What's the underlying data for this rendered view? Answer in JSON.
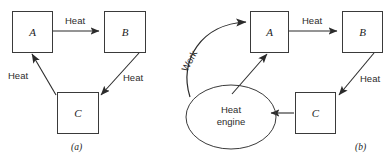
{
  "figure": {
    "type": "diagram",
    "title": "",
    "panels": [
      {
        "id": "a",
        "caption": "(a)",
        "nodes": [
          {
            "id": "A",
            "label": "A",
            "shape": "box"
          },
          {
            "id": "B",
            "label": "B",
            "shape": "box"
          },
          {
            "id": "C",
            "label": "C",
            "shape": "box"
          }
        ],
        "edges": [
          {
            "from": "A",
            "to": "B",
            "label": "Heat"
          },
          {
            "from": "B",
            "to": "C",
            "label": "Heat"
          },
          {
            "from": "C",
            "to": "A",
            "label": "Heat"
          }
        ]
      },
      {
        "id": "b",
        "caption": "(b)",
        "nodes": [
          {
            "id": "A",
            "label": "A",
            "shape": "box"
          },
          {
            "id": "B",
            "label": "B",
            "shape": "box"
          },
          {
            "id": "C",
            "label": "C",
            "shape": "box"
          },
          {
            "id": "engine",
            "label": "Heat engine",
            "label_line1": "Heat",
            "label_line2": "engine",
            "shape": "ellipse"
          }
        ],
        "edges": [
          {
            "from": "A",
            "to": "B",
            "label": "Heat"
          },
          {
            "from": "B",
            "to": "C",
            "label": "Heat"
          },
          {
            "from": "C",
            "to": "engine",
            "label": ""
          },
          {
            "from": "engine",
            "to": "A",
            "label": ""
          },
          {
            "from": "engine",
            "to": "A",
            "label": "Work",
            "style": "curved"
          }
        ]
      }
    ]
  },
  "colors": {
    "stroke": "#3a3a3a",
    "arrow": "#2b2b2b",
    "text": "#2b2b2b",
    "background": "#ffffff"
  }
}
